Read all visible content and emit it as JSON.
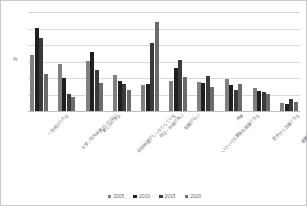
{
  "chart_data": {
    "type": "bar",
    "title": "",
    "xlabel": "",
    "ylabel": "%",
    "ylim": [
      0,
      12
    ],
    "yticks": [
      0,
      2,
      4,
      6,
      8,
      10,
      12
    ],
    "grid": true,
    "legend_position": "bottom",
    "categories": [
      "一生続けられる",
      "大学・短大卒業がいらない",
      "楽しみがある",
      "研修制度がしっかりしている",
      "休日・休暇が多い",
      "転勤がない",
      "いろいろな業務を経験できる",
      "将来",
      "若手から活躍できる",
      "事業を多角化している"
    ],
    "series": [
      {
        "name": "2005",
        "color": "#808080",
        "values": [
          6.8,
          5.7,
          6.1,
          4.4,
          3.2,
          3.6,
          3.5,
          3.9,
          2.75,
          1.0
        ]
      },
      {
        "name": "2010",
        "color": "#1f1f1f",
        "values": [
          10.1,
          4.0,
          7.15,
          3.6,
          3.3,
          5.2,
          3.4,
          3.1,
          2.4,
          0.85
        ]
      },
      {
        "name": "2015",
        "color": "#3a3a3a",
        "values": [
          8.9,
          2.1,
          5.0,
          3.25,
          8.25,
          6.15,
          4.3,
          2.6,
          2.3,
          1.4
        ]
      },
      {
        "name": "2020",
        "color": "#6b6b6b",
        "values": [
          4.5,
          1.7,
          3.4,
          2.5,
          10.75,
          4.15,
          2.95,
          3.25,
          2.1,
          1.1
        ]
      }
    ]
  },
  "legend": {
    "entries": [
      "2005",
      "2010",
      "2015",
      "2020"
    ]
  },
  "axes": {
    "y_unit_label": "%",
    "y_tick_labels": [
      "0",
      "2",
      "4",
      "6",
      "8",
      "10",
      "12"
    ]
  },
  "colors": {
    "gridline": "#d8d8d8",
    "axis": "#bdbdbd",
    "border": "#c9c9c9",
    "tick_text": "#6e6e6e",
    "xlabel_text": "#777777",
    "background": "#ffffff"
  }
}
